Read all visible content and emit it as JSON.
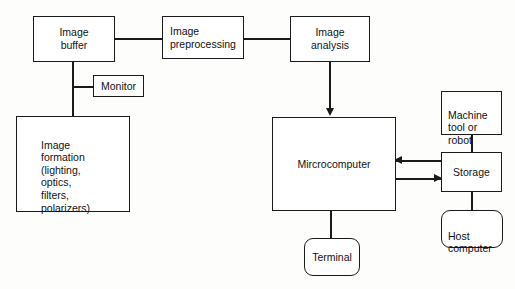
{
  "diagram": {
    "stroke_color": "#1a1a1a",
    "fill_color": "#ffffff",
    "text_color": "#111111",
    "nodes": [
      {
        "id": "image-buffer",
        "label": "Image\nbuffer",
        "shape": "rect",
        "align": "center"
      },
      {
        "id": "monitor",
        "label": "Monitor",
        "shape": "rect",
        "align": "center"
      },
      {
        "id": "image-formation",
        "label": "Image\nformation\n(lighting,\noptics,\nfilters,\npolarizers)",
        "shape": "rect",
        "align": "left"
      },
      {
        "id": "image-preprocessing",
        "label": "Image\npreprocessing",
        "shape": "rect",
        "align": "left"
      },
      {
        "id": "image-analysis",
        "label": "Image\nanalysis",
        "shape": "rect",
        "align": "center"
      },
      {
        "id": "microcomputer",
        "label": "Mircrocomputer",
        "shape": "rect",
        "align": "center"
      },
      {
        "id": "terminal",
        "label": "Terminal",
        "shape": "rounded-rect",
        "align": "center"
      },
      {
        "id": "machine-tool",
        "label": "Machine\ntool or\nrobot",
        "shape": "rect",
        "align": "left"
      },
      {
        "id": "storage",
        "label": "Storage",
        "shape": "rect",
        "align": "center"
      },
      {
        "id": "host-computer",
        "label": "Host\ncomputer",
        "shape": "rounded-rect",
        "align": "left"
      }
    ],
    "connections": [
      {
        "id": "buffer-preprocessing",
        "from": "image-buffer",
        "to": "image-preprocessing",
        "arrow": "none"
      },
      {
        "id": "preprocessing-analysis",
        "from": "image-preprocessing",
        "to": "image-analysis",
        "arrow": "none"
      },
      {
        "id": "analysis-microcomputer",
        "from": "image-analysis",
        "to": "microcomputer",
        "arrow": "down"
      },
      {
        "id": "buffer-monitor",
        "from": "image-buffer",
        "to": "monitor",
        "arrow": "none"
      },
      {
        "id": "buffer-formation",
        "from": "image-buffer",
        "to": "image-formation",
        "arrow": "none"
      },
      {
        "id": "microcomputer-terminal",
        "from": "microcomputer",
        "to": "terminal",
        "arrow": "none"
      },
      {
        "id": "storage-microcomputer",
        "from": "storage",
        "to": "microcomputer",
        "arrow": "left"
      },
      {
        "id": "microcomputer-storage",
        "from": "microcomputer",
        "to": "storage",
        "arrow": "right"
      },
      {
        "id": "machine-tool-storage",
        "from": "machine-tool",
        "to": "storage",
        "arrow": "none"
      },
      {
        "id": "storage-host",
        "from": "storage",
        "to": "host-computer",
        "arrow": "none"
      }
    ]
  }
}
